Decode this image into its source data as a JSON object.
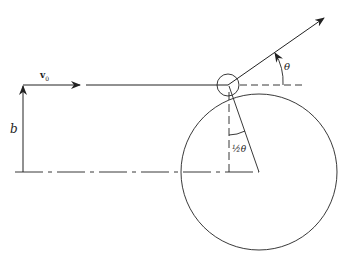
{
  "figure": {
    "labels": {
      "velocity": "v",
      "velocity_subscript": "0",
      "impact_parameter": "b",
      "scattering_angle": "θ",
      "half_angle": "½θ"
    },
    "colors": {
      "line": "#222222",
      "background": "#ffffff"
    }
  }
}
